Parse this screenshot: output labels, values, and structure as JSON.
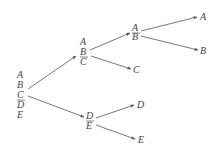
{
  "diagram": {
    "type": "binary-split-tree",
    "nodes": {
      "root": {
        "letters": [
          "A",
          "B",
          "C",
          "D",
          "E"
        ],
        "split_after": "C"
      },
      "abc": {
        "letters": [
          "A",
          "B",
          "C"
        ],
        "split_after": "B"
      },
      "ab": {
        "letters": [
          "A",
          "B"
        ],
        "split_after": "A"
      },
      "de": {
        "letters": [
          "D",
          "E"
        ],
        "split_after": "D"
      },
      "leaf_a": "A",
      "leaf_b": "B",
      "leaf_c": "C",
      "leaf_d": "D",
      "leaf_e": "E"
    },
    "edges": [
      [
        "root",
        "abc"
      ],
      [
        "root",
        "de"
      ],
      [
        "abc",
        "ab"
      ],
      [
        "abc",
        "leaf_c"
      ],
      [
        "ab",
        "leaf_a"
      ],
      [
        "ab",
        "leaf_b"
      ],
      [
        "de",
        "leaf_d"
      ],
      [
        "de",
        "leaf_e"
      ]
    ]
  }
}
